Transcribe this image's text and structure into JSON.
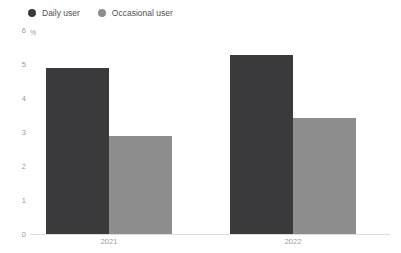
{
  "chart_data": {
    "type": "bar",
    "title": "",
    "subtitle": "",
    "xlabel": "",
    "ylabel": "%",
    "categories": [
      "2021",
      "2022"
    ],
    "series": [
      {
        "name": "Daily user",
        "color": "#3a3a3c",
        "values": [
          4.9,
          5.3
        ]
      },
      {
        "name": "Occasional user",
        "color": "#8d8d8d",
        "values": [
          2.9,
          3.45
        ]
      }
    ],
    "ylim": [
      0,
      6
    ],
    "yticks": [
      6,
      5,
      4,
      3,
      2,
      1,
      0
    ],
    "ytick_labels": [
      "6",
      "5",
      "4",
      "3",
      "2",
      "1",
      "0"
    ],
    "grid": false,
    "legend_position": "top-left",
    "bar_mode": "grouped",
    "annotations": []
  },
  "axis": {
    "unit_label": "%"
  },
  "legend": {
    "items": [
      {
        "label": "Daily user",
        "color": "#3a3a3c",
        "marker": "circle-dot-icon"
      },
      {
        "label": "Occasional user",
        "color": "#8d8d8d",
        "marker": "circle-dot-icon"
      }
    ]
  },
  "colors": {
    "daily_user": "#3a3a3c",
    "occasional_user": "#8d8d8d",
    "axis_line": "#dcdcdc",
    "tick_text": "#9a9a9a",
    "legend_text": "#4f4f4f",
    "background": "#ffffff"
  }
}
